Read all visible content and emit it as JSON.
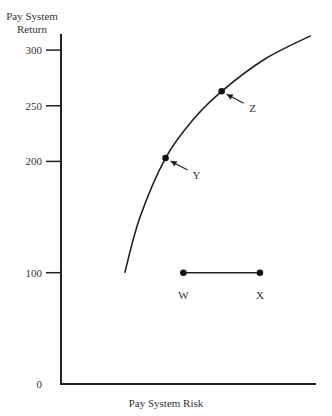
{
  "chart_data": {
    "type": "line",
    "title": "",
    "xlabel": "Pay System Risk",
    "ylabel_lines": [
      "Pay System",
      "Return"
    ],
    "yticks": [
      0,
      100,
      200,
      250,
      300
    ],
    "ytick_labels": [
      "0",
      "100",
      "200",
      "250",
      "300"
    ],
    "ylim": [
      0,
      320
    ],
    "xlim": [
      0,
      100
    ],
    "x_ticks_labeled": false,
    "grid": false,
    "legend": "none",
    "series": [
      {
        "name": "efficient-frontier",
        "type": "curve",
        "points": [
          [
            25,
            100
          ],
          [
            31,
            150
          ],
          [
            41,
            203
          ],
          [
            52,
            238
          ],
          [
            63,
            263
          ],
          [
            80,
            292
          ],
          [
            98,
            313
          ]
        ]
      },
      {
        "name": "W-X segment",
        "type": "segment",
        "points": [
          [
            48,
            100
          ],
          [
            78,
            100
          ]
        ]
      }
    ],
    "points": [
      {
        "label": "W",
        "x": 48,
        "y": 100,
        "annotation": "label-below"
      },
      {
        "label": "X",
        "x": 78,
        "y": 100,
        "annotation": "label-below"
      },
      {
        "label": "Y",
        "x": 41,
        "y": 203,
        "annotation": "arrow"
      },
      {
        "label": "Z",
        "x": 63,
        "y": 263,
        "annotation": "arrow"
      }
    ]
  }
}
